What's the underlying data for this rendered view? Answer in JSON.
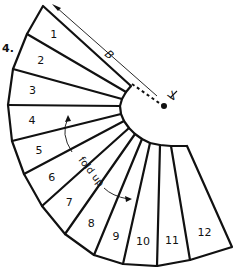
{
  "figure": {
    "figure_number": "4.",
    "panel_labels": [
      "1",
      "2",
      "3",
      "4",
      "5",
      "6",
      "7",
      "8",
      "9",
      "10",
      "11",
      "12"
    ],
    "dimension_label": "B",
    "vertex_label": "V",
    "fold_instruction": "fold up",
    "colors": {
      "stroke": "#111111",
      "background": "#ffffff"
    }
  }
}
